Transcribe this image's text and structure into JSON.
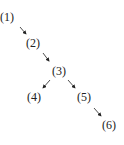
{
  "diagram": {
    "type": "tree",
    "nodes": [
      {
        "id": "1",
        "label": "(1)",
        "x": 0,
        "y": 11
      },
      {
        "id": "2",
        "label": "(2)",
        "x": 26,
        "y": 37
      },
      {
        "id": "3",
        "label": "(3)",
        "x": 52,
        "y": 65
      },
      {
        "id": "4",
        "label": "(4)",
        "x": 27,
        "y": 91
      },
      {
        "id": "5",
        "label": "(5)",
        "x": 77,
        "y": 91
      },
      {
        "id": "6",
        "label": "(6)",
        "x": 102,
        "y": 119
      }
    ],
    "edges": [
      {
        "from": "1",
        "to": "2"
      },
      {
        "from": "2",
        "to": "3"
      },
      {
        "from": "3",
        "to": "4"
      },
      {
        "from": "3",
        "to": "5"
      },
      {
        "from": "5",
        "to": "6"
      }
    ],
    "colors": {
      "stroke": "#222222",
      "background": "#ffffff"
    }
  }
}
